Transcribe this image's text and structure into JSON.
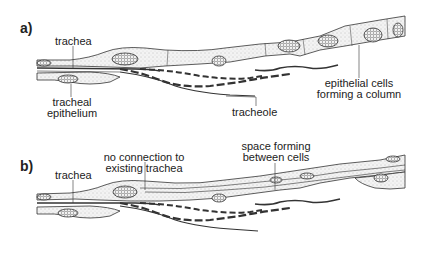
{
  "panels": {
    "a": {
      "label": "a)",
      "annotations": {
        "trachea": "trachea",
        "tracheal_epithelium_1": "tracheal",
        "tracheal_epithelium_2": "epithelium",
        "tracheole": "tracheole",
        "epithelial_cells_1": "epithelial cells",
        "epithelial_cells_2": "forming a column"
      }
    },
    "b": {
      "label": "b)",
      "annotations": {
        "trachea": "trachea",
        "no_connection_1": "no connection to",
        "no_connection_2": "existing trachea",
        "space_forming_1": "space forming",
        "space_forming_2": "between cells"
      }
    }
  },
  "colors": {
    "line": "#333333",
    "fill": "#f1f1f1",
    "stipple": "#9a9a9a"
  }
}
